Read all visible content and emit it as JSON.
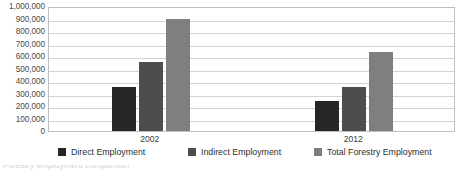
{
  "chart_data": {
    "type": "bar",
    "title": "",
    "subtitle": "",
    "xlabel": "",
    "ylabel": "",
    "categories": [
      "2002",
      "2012"
    ],
    "series": [
      {
        "name": "Direct Employment",
        "color": "#262626",
        "values": [
          350000,
          240000
        ]
      },
      {
        "name": "Indirect Employment",
        "color": "#4d4d4d",
        "values": [
          550000,
          350000
        ]
      },
      {
        "name": "Total Forestry Employment",
        "color": "#7f7f7f",
        "values": [
          900000,
          630000
        ]
      }
    ],
    "ylim": [
      0,
      1000000
    ],
    "ytick_step": 100000,
    "ytick_labels": [
      "1,000,000",
      "900,000",
      "800,000",
      "700,000",
      "600,000",
      "500,000",
      "400,000",
      "300,000",
      "200,000",
      "100,000",
      "0"
    ],
    "grid": true,
    "legend_position": "bottom",
    "plot_border_color": "#bfbfbf",
    "gridline_color": "#d4d4d4"
  },
  "legend": {
    "items": [
      {
        "label": "Direct Employment",
        "color": "#262626"
      },
      {
        "label": "Indirect Employment",
        "color": "#4d4d4d"
      },
      {
        "label": "Total Forestry Employment",
        "color": "#7f7f7f"
      }
    ]
  },
  "caption": {
    "text": "Forestry employment comparison"
  }
}
